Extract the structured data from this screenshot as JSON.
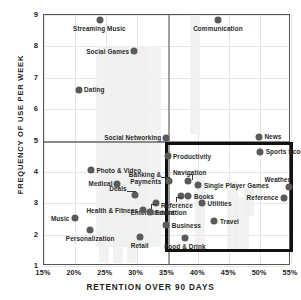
{
  "chart_data": {
    "type": "scatter",
    "title": "",
    "xlabel": "RETENTION OVER 90 DAYS",
    "ylabel": "FREQUENCY OF USE PER WEEK",
    "xlim": [
      15,
      55
    ],
    "ylim": [
      1,
      9
    ],
    "xticks": [
      "15%",
      "20%",
      "25%",
      "30%",
      "35%",
      "40%",
      "45%",
      "50%",
      "55%"
    ],
    "xtick_values": [
      15,
      20,
      25,
      30,
      35,
      40,
      45,
      50,
      55
    ],
    "yticks": [
      "1",
      "2",
      "3",
      "4",
      "5",
      "6",
      "7",
      "8",
      "9"
    ],
    "ytick_values": [
      1,
      2,
      3,
      4,
      5,
      6,
      7,
      8,
      9
    ],
    "grid": true,
    "legend": "none",
    "reference_lines": {
      "vertical_x": 35,
      "horizontal_y": 5
    },
    "highlight_box": {
      "x_range": [
        34.6,
        55.4
      ],
      "y_range": [
        1.45,
        4.95
      ]
    },
    "point_color": "#5a5a5a",
    "points": [
      {
        "label": "Streaming Music",
        "x": 24.0,
        "y": 8.85,
        "label_pos": "below"
      },
      {
        "label": "Social Games",
        "x": 29.6,
        "y": 7.85,
        "label_pos": "left"
      },
      {
        "label": "Communication",
        "x": 43.2,
        "y": 8.85,
        "label_pos": "below"
      },
      {
        "label": "Dating",
        "x": 20.6,
        "y": 6.62,
        "label_pos": "right"
      },
      {
        "label": "Social Networking",
        "x": 34.8,
        "y": 5.08,
        "label_pos": "left"
      },
      {
        "label": "News",
        "x": 49.8,
        "y": 5.12,
        "label_pos": "right"
      },
      {
        "label": "Sports Scores",
        "x": 50.0,
        "y": 4.62,
        "label_pos": "right2"
      },
      {
        "label": "Productivity",
        "x": 35.0,
        "y": 4.5,
        "label_pos": "right"
      },
      {
        "label": "Photo & Video",
        "x": 22.6,
        "y": 4.05,
        "label_pos": "right"
      },
      {
        "label": "Banking & Payments",
        "x": 35.3,
        "y": 3.72,
        "label_pos": "leadleft"
      },
      {
        "label": "Navigation",
        "x": 38.3,
        "y": 3.7,
        "label_pos": "leadup"
      },
      {
        "label": "Single Player Games",
        "x": 40.0,
        "y": 3.58,
        "label_pos": "right"
      },
      {
        "label": "Weather",
        "x": 54.6,
        "y": 3.52,
        "label_pos": "above"
      },
      {
        "label": "Medical",
        "x": 26.9,
        "y": 3.62,
        "label_pos": "left"
      },
      {
        "label": "Deals",
        "x": 29.7,
        "y": 3.25,
        "label_pos": "leadleft"
      },
      {
        "label": "Reference",
        "x": 37.2,
        "y": 3.22,
        "label_pos": "leaddown"
      },
      {
        "label": "Books",
        "x": 38.4,
        "y": 3.22,
        "label_pos": "right"
      },
      {
        "label": "Reference",
        "x": 53.8,
        "y": 3.18,
        "label_pos": "left"
      },
      {
        "label": "Entertainment",
        "x": 33.2,
        "y": 3.02,
        "label_pos": "leaddown"
      },
      {
        "label": "Utilities",
        "x": 40.6,
        "y": 3.0,
        "label_pos": "right"
      },
      {
        "label": "Health & Fitness",
        "x": 31.1,
        "y": 2.78,
        "label_pos": "left"
      },
      {
        "label": "Education",
        "x": 32.1,
        "y": 2.72,
        "label_pos": "right"
      },
      {
        "label": "Music",
        "x": 20.0,
        "y": 2.52,
        "label_pos": "left"
      },
      {
        "label": "Travel",
        "x": 42.6,
        "y": 2.42,
        "label_pos": "right"
      },
      {
        "label": "Business",
        "x": 34.8,
        "y": 2.3,
        "label_pos": "right"
      },
      {
        "label": "Personalization",
        "x": 22.5,
        "y": 2.15,
        "label_pos": "below"
      },
      {
        "label": "Retail",
        "x": 30.5,
        "y": 1.92,
        "label_pos": "below"
      },
      {
        "label": "Food & Drink",
        "x": 37.8,
        "y": 1.9,
        "label_pos": "below"
      }
    ]
  }
}
